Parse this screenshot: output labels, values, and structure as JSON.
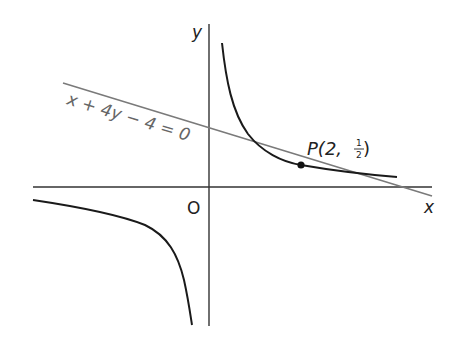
{
  "figure": {
    "axes": {
      "x_label": "x",
      "y_label": "y",
      "origin_label": "O"
    },
    "curve": {
      "name": "hyperbola",
      "equation": "y = 1/x",
      "color": "#1a1a1a"
    },
    "tangent_line": {
      "label": "x + 4y − 4 = 0",
      "color": "#7a7a7a"
    },
    "point": {
      "label_prefix": "P(2, ",
      "frac_num": "1",
      "frac_den": "2",
      "label_suffix": " )",
      "x": 2,
      "y": 0.5
    }
  }
}
